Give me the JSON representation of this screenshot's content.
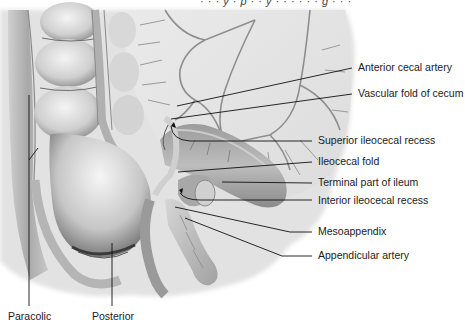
{
  "figure": {
    "top_cut_text": "· · · y · p · · y · · · · · · g · · ·",
    "labels_right": [
      {
        "id": "anterior-cecal-artery",
        "text": "Anterior cecal artery"
      },
      {
        "id": "vascular-fold-of-cecum",
        "text": "Vascular fold of cecum"
      },
      {
        "id": "superior-ileocecal-recess",
        "text": "Superior ileocecal recess"
      },
      {
        "id": "ileocecal-fold",
        "text": "Ileocecal fold"
      },
      {
        "id": "terminal-part-of-ileum",
        "text": "Terminal part of ileum"
      },
      {
        "id": "interior-ileocecal-recess",
        "text": "Interior ileocecal recess"
      },
      {
        "id": "mesoappendix",
        "text": "Mesoappendix"
      },
      {
        "id": "appendicular-artery",
        "text": "Appendicular artery"
      }
    ],
    "labels_bottom": [
      {
        "id": "paracolic",
        "text": "Paracolic"
      },
      {
        "id": "posterior",
        "text": "Posterior"
      }
    ],
    "colors": {
      "background": "#ffffff",
      "tissue_light": "#e6e6e6",
      "tissue_mid": "#b8b8b8",
      "tissue_dark": "#6e6e6e",
      "vessel": "#8a8a8a",
      "leader_line": "#111111",
      "text": "#1a1a1a"
    }
  }
}
